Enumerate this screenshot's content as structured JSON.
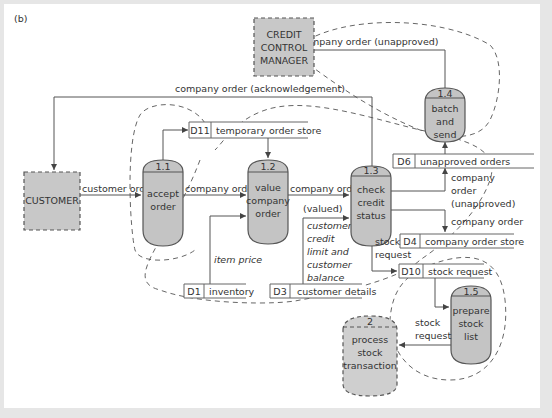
{
  "figure_label": "(b)",
  "external_entities": {
    "customer": "CUSTOMER",
    "credit_control_manager": [
      "CREDIT",
      "CONTROL",
      "MANAGER"
    ]
  },
  "processes": [
    {
      "id": "1.1",
      "lines": [
        "accept",
        "order"
      ]
    },
    {
      "id": "1.2",
      "lines": [
        "value",
        "company",
        "order"
      ]
    },
    {
      "id": "1.3",
      "lines": [
        "check",
        "credit",
        "status"
      ]
    },
    {
      "id": "1.4",
      "lines": [
        "batch",
        "and",
        "send"
      ]
    },
    {
      "id": "1.5",
      "lines": [
        "prepare",
        "stock",
        "list"
      ]
    },
    {
      "id": "2",
      "lines": [
        "process",
        "stock",
        "transaction"
      ]
    }
  ],
  "data_stores": [
    {
      "id": "D11",
      "name": "temporary order store"
    },
    {
      "id": "D6",
      "name": "unapproved orders"
    },
    {
      "id": "D4",
      "name": "company order store"
    },
    {
      "id": "D10",
      "name": "stock request"
    },
    {
      "id": "D1",
      "name": "inventory"
    },
    {
      "id": "D3",
      "name": "customer details"
    }
  ],
  "flows": {
    "ack": "company order (acknowledgement)",
    "unapproved_to_mgr": "company order (unapproved)",
    "customer_order": "customer order",
    "company_order_1": "company order",
    "company_order_valued": [
      "company order",
      "(valued)"
    ],
    "item_price": "item price",
    "customer_credit": [
      "customer",
      "credit",
      "limit and",
      "customer",
      "balance"
    ],
    "to_d6": [
      "company",
      "order",
      "(unapproved)"
    ],
    "to_d4": "company order",
    "stock_request_13": [
      "stock",
      "request"
    ],
    "stock_request_15": [
      "stock",
      "request"
    ]
  }
}
